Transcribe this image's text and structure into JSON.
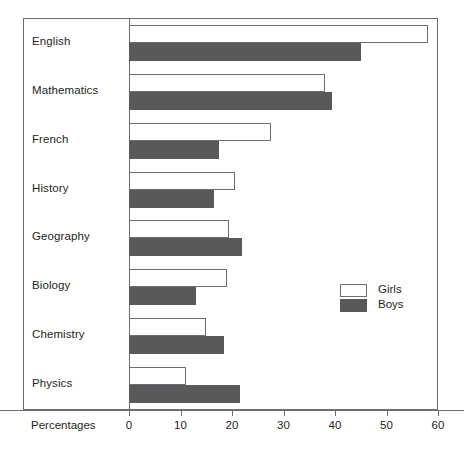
{
  "chart_data": {
    "type": "bar",
    "orientation": "horizontal",
    "title": "",
    "xlabel": "Percentages",
    "ylabel": "",
    "xlim": [
      0,
      60
    ],
    "xticks": [
      0,
      10,
      20,
      30,
      40,
      50,
      60
    ],
    "xtick_labels": [
      "0",
      "10",
      "20",
      "30",
      "40",
      "50",
      "60"
    ],
    "grid": false,
    "legend_position": "middle-right",
    "categories": [
      "English",
      "Mathematics",
      "French",
      "History",
      "Geography",
      "Biology",
      "Chemistry",
      "Physics"
    ],
    "series": [
      {
        "name": "Girls",
        "color": "#ffffff",
        "edge_color": "#6d6e71",
        "values": [
          58,
          38,
          27.5,
          20.5,
          19.5,
          19,
          15,
          11
        ]
      },
      {
        "name": "Boys",
        "color": "#58595b",
        "edge_color": "#58595b",
        "values": [
          45,
          39.5,
          17.5,
          16.5,
          22,
          13,
          18.5,
          21.5
        ]
      }
    ]
  },
  "legend": {
    "items": [
      {
        "label": "Girls",
        "swatch": "girls"
      },
      {
        "label": "Boys",
        "swatch": "boys"
      }
    ]
  },
  "colors": {
    "frame": "#6d6e71",
    "text": "#231f20",
    "boys_fill": "#58595b",
    "girls_fill": "#ffffff",
    "background": "#ffffff"
  }
}
